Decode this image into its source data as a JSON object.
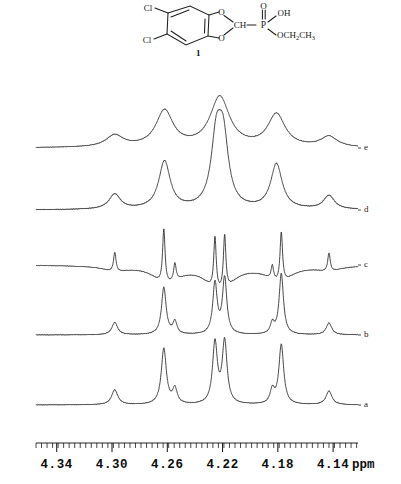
{
  "figure": {
    "compound_number": "1",
    "structure": {
      "atom_labels": [
        "Cl",
        "Cl",
        "O",
        "O",
        "O",
        "CH",
        "P",
        "OH",
        "OCH2CH3"
      ],
      "substituent_upper_left": "Cl",
      "substituent_lower_left": "Cl",
      "ring_oxygen_upper": "O",
      "ring_oxygen_lower": "O",
      "methine": "CH",
      "phosphorus": "P",
      "phosphoryl_oxygen": "O",
      "hydroxyl": "OH",
      "ethoxy": "OCH₂CH₃"
    }
  },
  "axis": {
    "unit": "ppm",
    "tick_labels": [
      "4.34",
      "4.30",
      "4.26",
      "4.22",
      "4.18",
      "4.14"
    ],
    "tick_values": [
      4.34,
      4.3,
      4.26,
      4.22,
      4.18,
      4.14
    ],
    "range_left_ppm": 4.355,
    "range_right_ppm": 4.122,
    "major_tick_count": 6,
    "minor_ticks_per_major": 10
  },
  "traces": [
    {
      "id": "e",
      "label": "e",
      "baseline_y": 76,
      "linewidth_hz": "broad"
    },
    {
      "id": "d",
      "label": "d",
      "baseline_y": 138,
      "linewidth_hz": "broad"
    },
    {
      "id": "c",
      "label": "c",
      "baseline_y": 193,
      "linewidth_hz": "resolution-enhanced"
    },
    {
      "id": "b",
      "label": "b",
      "baseline_y": 263,
      "linewidth_hz": "sharp"
    },
    {
      "id": "a",
      "label": "a",
      "baseline_y": 333,
      "linewidth_hz": "sharp"
    }
  ],
  "chart_data": {
    "type": "line",
    "title": "",
    "xlabel": "ppm",
    "ylabel": "",
    "xlim": [
      4.355,
      4.122
    ],
    "x_inverted": true,
    "grid": false,
    "legend": "right-margin trace letters",
    "tick_labels": [
      "4.34",
      "4.30",
      "4.26",
      "4.22",
      "4.18",
      "4.14"
    ],
    "series": [
      {
        "name": "e",
        "peaks_ppm": [
          4.298,
          4.262,
          4.222,
          4.181,
          4.143
        ],
        "peaks_height": [
          0.2,
          0.62,
          0.86,
          0.56,
          0.18
        ],
        "peaks_width": [
          0.0075,
          0.0075,
          0.0085,
          0.0075,
          0.0072
        ]
      },
      {
        "name": "d",
        "peaks_ppm": [
          4.298,
          4.262,
          4.2245,
          4.2195,
          4.181,
          4.143
        ],
        "peaks_height": [
          0.22,
          0.7,
          0.96,
          0.94,
          0.66,
          0.2
        ],
        "peaks_width": [
          0.005,
          0.005,
          0.0045,
          0.0045,
          0.005,
          0.0048
        ]
      },
      {
        "name": "c",
        "peaks_ppm": [
          4.298,
          4.2625,
          4.2545,
          4.2255,
          4.2185,
          4.184,
          4.1775,
          4.143
        ],
        "peaks_height": [
          0.36,
          1.0,
          0.32,
          0.96,
          1.0,
          0.26,
          0.92,
          0.34
        ],
        "peaks_width": [
          0.0011,
          0.0011,
          0.0011,
          0.0011,
          0.0011,
          0.0011,
          0.0011,
          0.0011
        ],
        "negative_lobes": true
      },
      {
        "name": "b",
        "peaks_ppm": [
          4.298,
          4.2625,
          4.2545,
          4.2255,
          4.2185,
          4.184,
          4.1775,
          4.143
        ],
        "peaks_height": [
          0.2,
          0.76,
          0.2,
          0.82,
          0.9,
          0.17,
          0.98,
          0.19
        ],
        "peaks_width": [
          0.0025,
          0.002,
          0.0018,
          0.0019,
          0.0019,
          0.0017,
          0.0019,
          0.0024
        ]
      },
      {
        "name": "a",
        "peaks_ppm": [
          4.298,
          4.2625,
          4.2545,
          4.2255,
          4.2185,
          4.184,
          4.1775,
          4.143
        ],
        "peaks_height": [
          0.24,
          0.9,
          0.24,
          0.98,
          1.0,
          0.22,
          0.96,
          0.22
        ],
        "peaks_width": [
          0.0027,
          0.0022,
          0.002,
          0.0021,
          0.0021,
          0.0019,
          0.0021,
          0.0026
        ]
      }
    ]
  }
}
